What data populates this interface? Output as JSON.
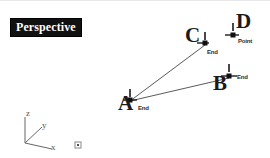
{
  "viewport": {
    "label": "Perspective",
    "background_color": "#ffffff",
    "geometry_color": "#4a4a4a",
    "marker_color": "#1a1a1a",
    "axis_color": "#555555",
    "width": 270,
    "height": 158
  },
  "vertices": [
    {
      "id": "A",
      "letter": "A",
      "snap_label": "End",
      "snap_type": "endpoint",
      "x": 130,
      "y": 100,
      "letter_x": 118,
      "letter_y": 100,
      "tip_x": 137,
      "tip_y": 106
    },
    {
      "id": "B",
      "letter": "B",
      "snap_label": "End",
      "snap_type": "endpoint",
      "x": 229,
      "y": 75,
      "letter_x": 213,
      "letter_y": 79,
      "tip_x": 236,
      "tip_y": 82
    },
    {
      "id": "C",
      "letter": "C",
      "snap_label": "End",
      "snap_type": "endpoint",
      "x": 205,
      "y": 42,
      "letter_x": 186,
      "letter_y": 29,
      "tip_x": 208,
      "tip_y": 50
    },
    {
      "id": "D",
      "letter": "D",
      "snap_label": "Point",
      "snap_type": "point",
      "x": 233,
      "y": 34,
      "letter_x": 237,
      "letter_y": 14,
      "tip_x": 238,
      "tip_y": 38
    }
  ],
  "edges": [
    {
      "id": "edge-a-c",
      "from": "A",
      "to": "C",
      "x1": 130,
      "y1": 100,
      "x2": 205,
      "y2": 44
    },
    {
      "id": "edge-a-b",
      "from": "A",
      "to": "B",
      "x1": 130,
      "y1": 100,
      "x2": 229,
      "y2": 77
    }
  ],
  "axis_triad": {
    "origin_x": 25,
    "origin_y": 142,
    "axes": [
      {
        "id": "z",
        "label": "z",
        "end_x": 25,
        "end_y": 116,
        "label_x": 26,
        "label_y": 111
      },
      {
        "id": "y",
        "label": "y",
        "end_x": 42,
        "end_y": 126,
        "label_x": 43,
        "label_y": 124
      },
      {
        "id": "x",
        "label": "x",
        "end_x": 52,
        "end_y": 148,
        "label_x": 52,
        "label_y": 144
      }
    ]
  },
  "pickbox": {
    "id": "pickbox",
    "x": 75,
    "y": 141,
    "size": 6
  }
}
